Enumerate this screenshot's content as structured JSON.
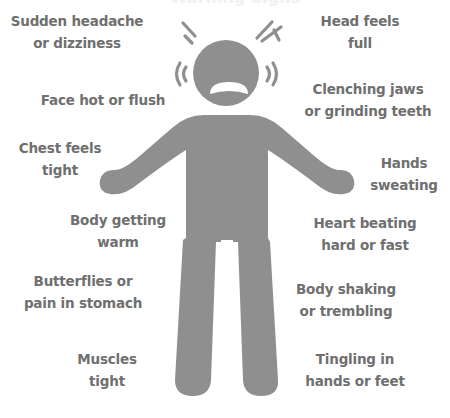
{
  "title_fragment": "Warning Signs",
  "figure": {
    "colors": {
      "figure": "#8f8f8f",
      "text": "#6f6f6f",
      "background": "#ffffff"
    }
  },
  "labels": {
    "left": [
      {
        "lines": [
          "Sudden headache",
          "or dizziness"
        ]
      },
      {
        "lines": [
          "Face hot or flush"
        ]
      },
      {
        "lines": [
          "Chest feels",
          "tight"
        ]
      },
      {
        "lines": [
          "Body getting",
          "warm"
        ]
      },
      {
        "lines": [
          "Butterflies or",
          "pain in stomach"
        ]
      },
      {
        "lines": [
          "Muscles",
          "tight"
        ]
      }
    ],
    "right": [
      {
        "lines": [
          "Head feels",
          "full"
        ]
      },
      {
        "lines": [
          "Clenching jaws",
          "or grinding teeth"
        ]
      },
      {
        "lines": [
          "Hands",
          "sweating"
        ]
      },
      {
        "lines": [
          "Heart beating",
          "hard or fast"
        ]
      },
      {
        "lines": [
          "Body shaking",
          "or trembling"
        ]
      },
      {
        "lines": [
          "Tingling in",
          "hands or feet"
        ]
      }
    ]
  }
}
